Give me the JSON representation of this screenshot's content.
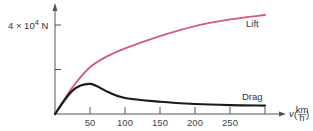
{
  "chart_data": {
    "type": "line",
    "title": "",
    "xlabel": "v (km/h)",
    "xlabel_var": "v",
    "xlabel_unit_num": "km",
    "xlabel_unit_den": "h",
    "ylabel": "N",
    "y_tick_label": "4 × 10",
    "y_tick_exp": "4",
    "y_tick_unit": "N",
    "x_ticks": [
      50,
      100,
      150,
      200,
      250
    ],
    "x_tick_labels": [
      "50",
      "100",
      "150",
      "200",
      "250"
    ],
    "xlim": [
      0,
      300
    ],
    "ylim": [
      0,
      50000
    ],
    "grid": false,
    "legend": "inline labels",
    "series": [
      {
        "name": "Lift",
        "color": "#d6587c",
        "x": [
          0,
          25,
          50,
          75,
          100,
          150,
          200,
          250,
          300
        ],
        "values": [
          0,
          12000,
          21000,
          26000,
          29500,
          35000,
          39500,
          42500,
          44500
        ]
      },
      {
        "name": "Drag",
        "color": "#1a1a1a",
        "x": [
          0,
          25,
          50,
          75,
          100,
          150,
          200,
          250,
          300
        ],
        "values": [
          0,
          10500,
          13500,
          10000,
          7200,
          5500,
          4500,
          4000,
          3800
        ]
      }
    ]
  }
}
